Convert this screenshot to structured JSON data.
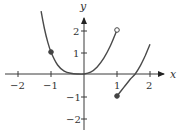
{
  "chart_data": {
    "type": "line",
    "title": "",
    "xlabel": "x",
    "ylabel": "y",
    "xlim": [
      -2.5,
      2.5
    ],
    "ylim": [
      -2.5,
      3
    ],
    "grid": false,
    "x_ticks": [
      -2,
      -1,
      1,
      2
    ],
    "x_tick_labels": [
      "−2",
      "−1",
      "1",
      "2"
    ],
    "y_ticks": [
      2,
      1,
      -1,
      -2
    ],
    "y_tick_labels": [
      "2",
      "1",
      "−1",
      "−2"
    ],
    "series": [
      {
        "name": "left-and-middle piece",
        "x": [
          -1.3,
          -1.2,
          -1.1,
          -1.0,
          -0.8,
          -0.6,
          -0.4,
          -0.2,
          0.0,
          0.2,
          0.4,
          0.6,
          0.8,
          1.0
        ],
        "y": [
          2.86,
          2.07,
          1.46,
          1.0,
          0.41,
          0.13,
          0.03,
          0.0,
          0.0,
          0.08,
          0.32,
          0.72,
          1.28,
          2.0
        ],
        "end_right": "open"
      },
      {
        "name": "right piece",
        "x": [
          1.0,
          1.2,
          1.4,
          1.55,
          1.7,
          1.85,
          2.0
        ],
        "y": [
          -1.0,
          -0.62,
          -0.24,
          0.0,
          0.36,
          0.82,
          1.35
        ],
        "end_left": "closed"
      }
    ],
    "points": [
      {
        "x": -1,
        "y": 1,
        "style": "filled"
      },
      {
        "x": 1,
        "y": 2,
        "style": "open"
      },
      {
        "x": 1,
        "y": -1,
        "style": "filled"
      }
    ]
  },
  "axes": {
    "x_label": "x",
    "y_label": "y",
    "x_tick_labels": [
      "−2",
      "−1",
      "1",
      "2"
    ],
    "y_tick_labels": [
      "2",
      "1",
      "−1",
      "−2"
    ]
  }
}
